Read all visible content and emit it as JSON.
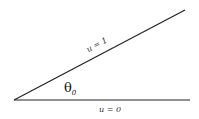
{
  "diagram": {
    "upper_line_label": "u = 1",
    "lower_line_label": "u = 0",
    "angle_symbol": "θ",
    "angle_subscript": "0",
    "line_color": "#222222",
    "vertex": [
      14,
      100
    ],
    "lower_line_end": [
      190,
      100
    ],
    "upper_line_end": [
      185,
      10
    ]
  }
}
